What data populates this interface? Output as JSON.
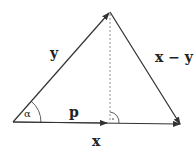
{
  "diagram": {
    "type": "vector projection",
    "labels": {
      "y": "y",
      "x_minus_y": "x − y",
      "alpha": "α",
      "p": "p",
      "x": "x"
    },
    "colors": {
      "stroke": "#333333",
      "dashed": "#777777"
    }
  }
}
